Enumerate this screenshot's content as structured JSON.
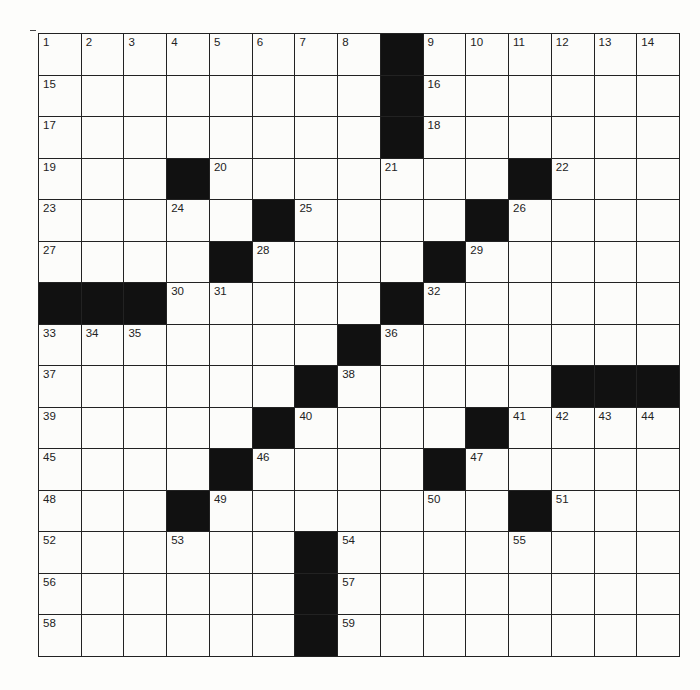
{
  "puzzle": {
    "rows": 15,
    "cols": 15,
    "black_cells": [
      [
        0,
        8
      ],
      [
        1,
        8
      ],
      [
        2,
        8
      ],
      [
        3,
        3
      ],
      [
        3,
        11
      ],
      [
        4,
        5
      ],
      [
        4,
        10
      ],
      [
        5,
        4
      ],
      [
        5,
        9
      ],
      [
        6,
        0
      ],
      [
        6,
        1
      ],
      [
        6,
        2
      ],
      [
        6,
        8
      ],
      [
        7,
        7
      ],
      [
        8,
        6
      ],
      [
        8,
        12
      ],
      [
        8,
        13
      ],
      [
        8,
        14
      ],
      [
        9,
        5
      ],
      [
        9,
        10
      ],
      [
        10,
        4
      ],
      [
        10,
        9
      ],
      [
        11,
        3
      ],
      [
        11,
        11
      ],
      [
        12,
        6
      ],
      [
        13,
        6
      ],
      [
        14,
        6
      ]
    ],
    "numbers": [
      {
        "r": 0,
        "c": 0,
        "n": "1"
      },
      {
        "r": 0,
        "c": 1,
        "n": "2"
      },
      {
        "r": 0,
        "c": 2,
        "n": "3"
      },
      {
        "r": 0,
        "c": 3,
        "n": "4"
      },
      {
        "r": 0,
        "c": 4,
        "n": "5"
      },
      {
        "r": 0,
        "c": 5,
        "n": "6"
      },
      {
        "r": 0,
        "c": 6,
        "n": "7"
      },
      {
        "r": 0,
        "c": 7,
        "n": "8"
      },
      {
        "r": 0,
        "c": 9,
        "n": "9"
      },
      {
        "r": 0,
        "c": 10,
        "n": "10"
      },
      {
        "r": 0,
        "c": 11,
        "n": "11"
      },
      {
        "r": 0,
        "c": 12,
        "n": "12"
      },
      {
        "r": 0,
        "c": 13,
        "n": "13"
      },
      {
        "r": 0,
        "c": 14,
        "n": "14"
      },
      {
        "r": 1,
        "c": 0,
        "n": "15"
      },
      {
        "r": 1,
        "c": 9,
        "n": "16"
      },
      {
        "r": 2,
        "c": 0,
        "n": "17"
      },
      {
        "r": 2,
        "c": 9,
        "n": "18"
      },
      {
        "r": 3,
        "c": 0,
        "n": "19"
      },
      {
        "r": 3,
        "c": 4,
        "n": "20"
      },
      {
        "r": 3,
        "c": 8,
        "n": "21"
      },
      {
        "r": 3,
        "c": 12,
        "n": "22"
      },
      {
        "r": 4,
        "c": 0,
        "n": "23"
      },
      {
        "r": 4,
        "c": 3,
        "n": "24"
      },
      {
        "r": 4,
        "c": 6,
        "n": "25"
      },
      {
        "r": 4,
        "c": 11,
        "n": "26"
      },
      {
        "r": 5,
        "c": 0,
        "n": "27"
      },
      {
        "r": 5,
        "c": 5,
        "n": "28"
      },
      {
        "r": 5,
        "c": 10,
        "n": "29"
      },
      {
        "r": 6,
        "c": 3,
        "n": "30"
      },
      {
        "r": 6,
        "c": 4,
        "n": "31"
      },
      {
        "r": 6,
        "c": 9,
        "n": "32"
      },
      {
        "r": 7,
        "c": 0,
        "n": "33"
      },
      {
        "r": 7,
        "c": 1,
        "n": "34"
      },
      {
        "r": 7,
        "c": 2,
        "n": "35"
      },
      {
        "r": 7,
        "c": 8,
        "n": "36"
      },
      {
        "r": 8,
        "c": 0,
        "n": "37"
      },
      {
        "r": 8,
        "c": 7,
        "n": "38"
      },
      {
        "r": 9,
        "c": 0,
        "n": "39"
      },
      {
        "r": 9,
        "c": 6,
        "n": "40"
      },
      {
        "r": 9,
        "c": 11,
        "n": "41"
      },
      {
        "r": 9,
        "c": 12,
        "n": "42"
      },
      {
        "r": 9,
        "c": 13,
        "n": "43"
      },
      {
        "r": 9,
        "c": 14,
        "n": "44"
      },
      {
        "r": 10,
        "c": 0,
        "n": "45"
      },
      {
        "r": 10,
        "c": 5,
        "n": "46"
      },
      {
        "r": 10,
        "c": 10,
        "n": "47"
      },
      {
        "r": 11,
        "c": 0,
        "n": "48"
      },
      {
        "r": 11,
        "c": 4,
        "n": "49"
      },
      {
        "r": 11,
        "c": 9,
        "n": "50"
      },
      {
        "r": 11,
        "c": 12,
        "n": "51"
      },
      {
        "r": 12,
        "c": 0,
        "n": "52"
      },
      {
        "r": 12,
        "c": 3,
        "n": "53"
      },
      {
        "r": 12,
        "c": 7,
        "n": "54"
      },
      {
        "r": 12,
        "c": 11,
        "n": "55"
      },
      {
        "r": 13,
        "c": 0,
        "n": "56"
      },
      {
        "r": 13,
        "c": 7,
        "n": "57"
      },
      {
        "r": 14,
        "c": 0,
        "n": "58"
      },
      {
        "r": 14,
        "c": 7,
        "n": "59"
      }
    ]
  }
}
